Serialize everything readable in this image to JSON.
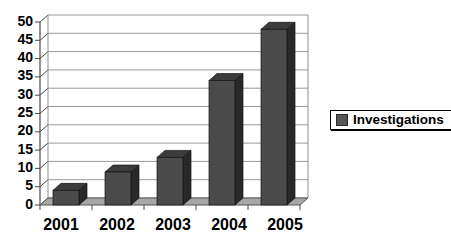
{
  "chart_data": {
    "type": "bar",
    "variant": "3d-column",
    "title": "",
    "xlabel": "",
    "ylabel": "",
    "categories": [
      "2001",
      "2002",
      "2003",
      "2004",
      "2005"
    ],
    "series": [
      {
        "name": "Investigations",
        "values": [
          4,
          9,
          13,
          34,
          48
        ]
      }
    ],
    "ylim": [
      0,
      50
    ],
    "ytick_step": 5,
    "ytick_labels": [
      "0",
      "5",
      "10",
      "15",
      "20",
      "25",
      "30",
      "35",
      "40",
      "45",
      "50"
    ],
    "grid": true,
    "legend": {
      "position": "right",
      "entries": [
        "Investigations"
      ]
    },
    "colors": {
      "bar_front": "#4a4a4a",
      "bar_side": "#292929",
      "bar_top": "#3c3c3c",
      "bar_outline": "#141414",
      "floor": "#a7a7a7",
      "floor_edge": "#555555",
      "gridline": "#999999",
      "axis": "#4a4a4a",
      "wall_edge": "#8f8f8f",
      "text": "#000000",
      "background": "#ffffff"
    }
  }
}
